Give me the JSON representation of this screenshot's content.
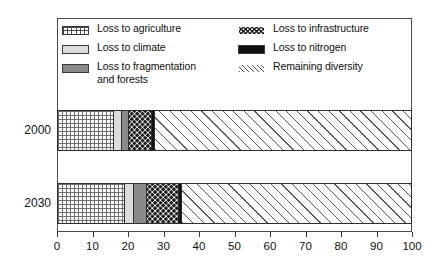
{
  "chart_data": {
    "type": "bar",
    "orientation": "horizontal",
    "stacked": true,
    "title": "",
    "xlabel": "",
    "ylabel": "",
    "xlim": [
      0,
      100
    ],
    "xticks": [
      0,
      10,
      20,
      30,
      40,
      50,
      60,
      70,
      80,
      90,
      100
    ],
    "xtick_labels": [
      "0",
      "10",
      "20",
      "30",
      "40",
      "50",
      "60",
      "70",
      "80",
      "90",
      "100"
    ],
    "grid": false,
    "legend_position": "inside-top",
    "categories": [
      "2000",
      "2030"
    ],
    "series": [
      {
        "name": "Loss to agriculture",
        "pattern": "grid",
        "color": "#6d6d6d",
        "values": [
          16.0,
          19.0
        ]
      },
      {
        "name": "Loss to climate",
        "pattern": "solid-light-gray",
        "color": "#dcdcdc",
        "values": [
          2.0,
          2.4
        ]
      },
      {
        "name": "Loss to fragmentation and forests",
        "pattern": "solid-mid-gray",
        "color": "#8a8a8a",
        "values": [
          2.0,
          3.9
        ]
      },
      {
        "name": "Loss to infrastructure",
        "pattern": "dots",
        "color": "#1b1b1b",
        "values": [
          6.6,
          9.0
        ]
      },
      {
        "name": "Loss to nitrogen",
        "pattern": "solid-black",
        "color": "#111111",
        "values": [
          0.9,
          0.8
        ]
      },
      {
        "name": "Remaining diversity",
        "pattern": "diagonal-hatch",
        "color": "#5b5b5b",
        "values": [
          72.5,
          64.9
        ]
      }
    ],
    "cumulative_boundaries": {
      "2000": [
        16.0,
        18.0,
        20.0,
        26.6,
        27.5,
        100.0
      ],
      "2030": [
        19.0,
        21.4,
        25.3,
        34.3,
        35.1,
        100.0
      ]
    }
  },
  "legend": {
    "left_column": [
      {
        "label": "Loss to agriculture",
        "swatch": "grid-swatch"
      },
      {
        "label": "Loss to climate",
        "swatch": "light-gray-swatch"
      },
      {
        "label": "Loss to fragmentation\nand forests",
        "swatch": "mid-gray-swatch"
      }
    ],
    "right_column": [
      {
        "label": "Loss to infrastructure",
        "swatch": "dots-swatch"
      },
      {
        "label": "Loss to nitrogen",
        "swatch": "black-swatch"
      },
      {
        "label": "Remaining diversity",
        "swatch": "hatch-swatch"
      }
    ]
  },
  "axis": {
    "y_labels": [
      "2000",
      "2030"
    ],
    "x_labels": [
      "0",
      "10",
      "20",
      "30",
      "40",
      "50",
      "60",
      "70",
      "80",
      "90",
      "100"
    ]
  }
}
